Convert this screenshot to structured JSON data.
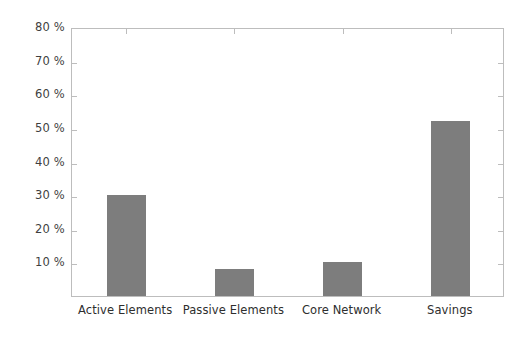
{
  "chart_data": {
    "type": "bar",
    "title": "",
    "xlabel": "",
    "ylabel": "",
    "categories": [
      "Active Elements",
      "Passive Elements",
      "Core Network",
      "Savings"
    ],
    "values": [
      30,
      8,
      10,
      52
    ],
    "value_unit": "%",
    "ylim": [
      0,
      80
    ],
    "y_ticks": [
      10,
      20,
      30,
      40,
      50,
      60,
      70,
      80
    ],
    "y_tick_labels": [
      "10 %",
      "20 %",
      "30 %",
      "40 %",
      "50 %",
      "60 %",
      "70 %",
      "80 %"
    ],
    "grid": false,
    "legend": null,
    "bar_color": "#7d7d7d",
    "axis_color": "#bdbdbd",
    "background_color": "#ffffff"
  }
}
